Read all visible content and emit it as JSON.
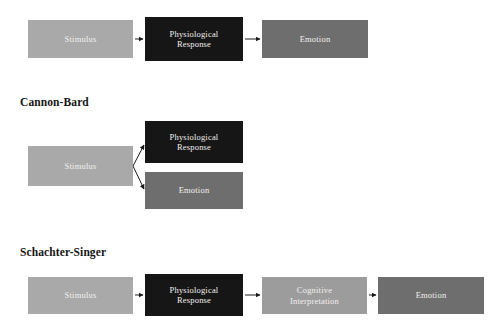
{
  "page": {
    "width": 495,
    "height": 333,
    "background": "#ffffff",
    "kind": "emotion-theories-diagram"
  },
  "palette": {
    "stimulus_fill": "#a9a9a9",
    "physiological_fill": "#161616",
    "emotion_fill": "#6e6e6e",
    "cognitive_fill": "#9c9c9c",
    "box_text": "#f2f0ee",
    "title_text": "#141414",
    "arrow": "#1a1a1a"
  },
  "sections": [
    {
      "id": "james-lange",
      "title": "",
      "title_visible": false,
      "nodes": [
        {
          "id": "s1-stimulus",
          "label": "Stimulus",
          "fill": "stimulus_fill",
          "x": 28,
          "y": 20,
          "w": 105,
          "h": 38,
          "font_size": 8.5
        },
        {
          "id": "s1-physiological",
          "label": "Physiological\nResponse",
          "fill": "physiological_fill",
          "x": 145,
          "y": 17,
          "w": 98,
          "h": 44,
          "font_size": 8.5
        },
        {
          "id": "s1-emotion",
          "label": "Emotion",
          "fill": "emotion_fill",
          "x": 262,
          "y": 20,
          "w": 106,
          "h": 38,
          "font_size": 8.5
        }
      ],
      "arrows": [
        {
          "from": "s1-stimulus",
          "to": "s1-physiological",
          "x1": 135,
          "y1": 39,
          "x2": 143,
          "y2": 39
        },
        {
          "from": "s1-physiological",
          "to": "s1-emotion",
          "x1": 245,
          "y1": 39,
          "x2": 260,
          "y2": 39
        }
      ]
    },
    {
      "id": "cannon-bard",
      "title": "Cannon-Bard",
      "title_visible": true,
      "title_x": 20,
      "title_y": 96,
      "title_font_size": 11.5,
      "nodes": [
        {
          "id": "s2-stimulus",
          "label": "Stimulus",
          "fill": "stimulus_fill",
          "x": 28,
          "y": 146,
          "w": 105,
          "h": 40,
          "font_size": 8.5
        },
        {
          "id": "s2-physiological",
          "label": "Physiological\nResponse",
          "fill": "physiological_fill",
          "x": 145,
          "y": 121,
          "w": 98,
          "h": 42,
          "font_size": 8.5
        },
        {
          "id": "s2-emotion",
          "label": "Emotion",
          "fill": "emotion_fill",
          "x": 145,
          "y": 172,
          "w": 98,
          "h": 37,
          "font_size": 8.5
        }
      ],
      "arrows": [
        {
          "from": "s2-stimulus",
          "to": "s2-physiological",
          "x1": 133,
          "y1": 166,
          "x2": 144,
          "y2": 145
        },
        {
          "from": "s2-stimulus",
          "to": "s2-emotion",
          "x1": 133,
          "y1": 166,
          "x2": 144,
          "y2": 189
        }
      ]
    },
    {
      "id": "schachter-singer",
      "title": "Schachter-Singer",
      "title_visible": true,
      "title_x": 20,
      "title_y": 246,
      "title_font_size": 11.5,
      "nodes": [
        {
          "id": "s3-stimulus",
          "label": "Stimulus",
          "fill": "stimulus_fill",
          "x": 28,
          "y": 277,
          "w": 105,
          "h": 37,
          "font_size": 8.5
        },
        {
          "id": "s3-physiological",
          "label": "Physiological\nResponse",
          "fill": "physiological_fill",
          "x": 145,
          "y": 274,
          "w": 98,
          "h": 42,
          "font_size": 8.5
        },
        {
          "id": "s3-cognitive",
          "label": "Cognitive\nInterpretation",
          "fill": "cognitive_fill",
          "x": 262,
          "y": 277,
          "w": 105,
          "h": 37,
          "font_size": 8.5
        },
        {
          "id": "s3-emotion",
          "label": "Emotion",
          "fill": "emotion_fill",
          "x": 378,
          "y": 277,
          "w": 106,
          "h": 37,
          "font_size": 8.5
        }
      ],
      "arrows": [
        {
          "from": "s3-stimulus",
          "to": "s3-physiological",
          "x1": 135,
          "y1": 295,
          "x2": 143,
          "y2": 295
        },
        {
          "from": "s3-physiological",
          "to": "s3-cognitive",
          "x1": 245,
          "y1": 295,
          "x2": 260,
          "y2": 295
        },
        {
          "from": "s3-cognitive",
          "to": "s3-emotion",
          "x1": 369,
          "y1": 295,
          "x2": 376,
          "y2": 295
        }
      ]
    }
  ]
}
